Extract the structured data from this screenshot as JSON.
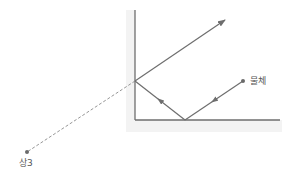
{
  "diagram": {
    "title": "",
    "type": "corner-mirror-reflection",
    "colors": {
      "mirror": "#6e6e6e",
      "mirror_backing": "#f3f3f3",
      "ray": "#6e6e6e",
      "dashed_ray": "#8a8a8a",
      "point": "#6a6a6a",
      "label": "#555555"
    },
    "labels": {
      "object": "물체",
      "image": "상3"
    },
    "geometry": {
      "vertical_mirror": {
        "x": 135,
        "y1": 10,
        "y2": 120
      },
      "horizontal_mirror": {
        "y": 120,
        "x1": 135,
        "x2": 280
      },
      "object_point": {
        "x": 243,
        "y": 81
      },
      "bottom_reflection_point": {
        "x": 185,
        "y": 120
      },
      "side_reflection_point": {
        "x": 135,
        "y": 81
      },
      "outgoing_ray_end": {
        "x": 225,
        "y": 20
      },
      "image_point": {
        "x": 27,
        "y": 152
      }
    }
  }
}
